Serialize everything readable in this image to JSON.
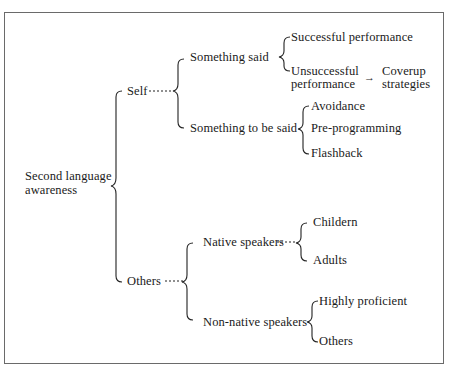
{
  "diagram": {
    "root": {
      "line1": "Second language",
      "line2": "awareness"
    },
    "self": {
      "label": "Self",
      "something_said": {
        "label": "Something said",
        "successful": "Successful performance",
        "unsuccessful": {
          "line1": "Unsuccessful",
          "line2": "performance"
        },
        "arrow": "→",
        "coverup": {
          "line1": "Coverup",
          "line2": "strategies"
        }
      },
      "something_to_be_said": {
        "label": "Something to be said",
        "items": [
          "Avoidance",
          "Pre-programming",
          "Flashback"
        ]
      }
    },
    "others": {
      "label": "Others",
      "native_speakers": {
        "label": "Native speakers",
        "items": [
          "Childern",
          "Adults"
        ]
      },
      "non_native_speakers": {
        "label": "Non-native speakers",
        "items": [
          "Highly proficient",
          "Others"
        ]
      }
    }
  }
}
